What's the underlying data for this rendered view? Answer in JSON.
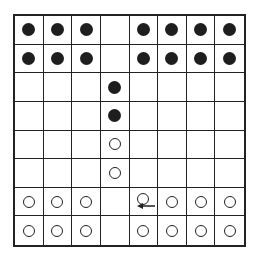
{
  "diagram": {
    "type": "board",
    "rows": 8,
    "cols": 8,
    "colors": {
      "black_piece": "#1e1e1e",
      "white_piece": "#ffffff",
      "grid": "#222222"
    },
    "pieces": [
      {
        "row": 0,
        "col": 0,
        "color": "black"
      },
      {
        "row": 0,
        "col": 1,
        "color": "black"
      },
      {
        "row": 0,
        "col": 2,
        "color": "black"
      },
      {
        "row": 0,
        "col": 4,
        "color": "black"
      },
      {
        "row": 0,
        "col": 5,
        "color": "black"
      },
      {
        "row": 0,
        "col": 6,
        "color": "black"
      },
      {
        "row": 0,
        "col": 7,
        "color": "black"
      },
      {
        "row": 1,
        "col": 0,
        "color": "black"
      },
      {
        "row": 1,
        "col": 1,
        "color": "black"
      },
      {
        "row": 1,
        "col": 2,
        "color": "black"
      },
      {
        "row": 1,
        "col": 4,
        "color": "black"
      },
      {
        "row": 1,
        "col": 5,
        "color": "black"
      },
      {
        "row": 1,
        "col": 6,
        "color": "black"
      },
      {
        "row": 1,
        "col": 7,
        "color": "black"
      },
      {
        "row": 2,
        "col": 3,
        "color": "black"
      },
      {
        "row": 3,
        "col": 3,
        "color": "black"
      },
      {
        "row": 4,
        "col": 3,
        "color": "white"
      },
      {
        "row": 5,
        "col": 3,
        "color": "white"
      },
      {
        "row": 6,
        "col": 0,
        "color": "white"
      },
      {
        "row": 6,
        "col": 1,
        "color": "white"
      },
      {
        "row": 6,
        "col": 2,
        "color": "white"
      },
      {
        "row": 6,
        "col": 4,
        "color": "white"
      },
      {
        "row": 6,
        "col": 5,
        "color": "white"
      },
      {
        "row": 6,
        "col": 6,
        "color": "white"
      },
      {
        "row": 6,
        "col": 7,
        "color": "white"
      },
      {
        "row": 7,
        "col": 0,
        "color": "white"
      },
      {
        "row": 7,
        "col": 1,
        "color": "white"
      },
      {
        "row": 7,
        "col": 2,
        "color": "white"
      },
      {
        "row": 7,
        "col": 4,
        "color": "white"
      },
      {
        "row": 7,
        "col": 5,
        "color": "white"
      },
      {
        "row": 7,
        "col": 6,
        "color": "white"
      },
      {
        "row": 7,
        "col": 7,
        "color": "white"
      }
    ],
    "arrows": [
      {
        "row": 6,
        "col": 4,
        "direction": "left",
        "icon": "arrow-left-icon"
      }
    ]
  }
}
